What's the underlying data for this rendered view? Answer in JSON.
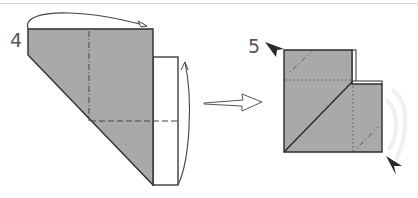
{
  "diagram": {
    "colors": {
      "paper_colored": "#a9a9a9",
      "paper_white": "#ffffff",
      "outline": "#2e2e2e",
      "fold_lines": "#555555",
      "arrow": "#444444",
      "background": "#ffffff"
    },
    "steps": [
      {
        "number": "4",
        "description": "Fold the left part behind (valley fold along dash-dot line) and fold the white strip up along the dashed line",
        "fold_arrows": [
          "top-over-arrow",
          "right-strip-up-arrow"
        ],
        "fold_lines": [
          "vertical mountain fold (dash-dot)",
          "horizontal valley fold (dashed)"
        ]
      },
      {
        "number": "5",
        "description": "Resulting shape; squash-fold indicated corners",
        "markers": [
          "top-left pointer",
          "bottom-right pointer"
        ],
        "fold_lines": [
          "horizontal dotted line",
          "vertical dotted line",
          "two diagonal dash-dot corner creases"
        ]
      }
    ],
    "transition_arrow": "hollow-right-arrow"
  }
}
